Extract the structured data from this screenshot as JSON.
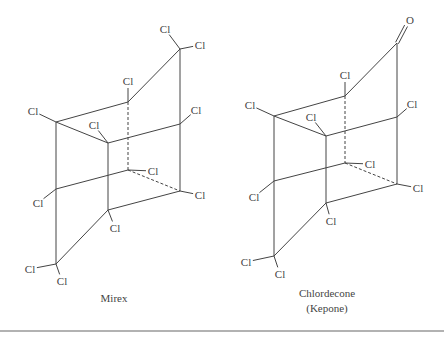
{
  "molecules": [
    {
      "name": "Mirex",
      "caption": [
        "Mirex"
      ],
      "caption_pos": [
        114,
        291
      ],
      "vertices": {
        "top": [
          180,
          49
        ],
        "tm": [
          128,
          102
        ],
        "tl": [
          56,
          122
        ],
        "ft": [
          108,
          143
        ],
        "rt": [
          180,
          124
        ],
        "bb": [
          128,
          170
        ],
        "lb": [
          56,
          189
        ],
        "fb": [
          108,
          210
        ],
        "rb": [
          180,
          191
        ],
        "bot": [
          56,
          264
        ]
      },
      "bonds": [
        [
          "top",
          "tm"
        ],
        [
          "top",
          "rt"
        ],
        [
          "tm",
          "tl"
        ],
        [
          "tl",
          "ft"
        ],
        [
          "ft",
          "rt"
        ],
        [
          "tl",
          "lb"
        ],
        [
          "ft",
          "fb"
        ],
        [
          "rt",
          "rb"
        ],
        [
          "lb",
          "bb"
        ],
        [
          "fb",
          "rb"
        ],
        [
          "fb",
          "bot"
        ],
        [
          "lb",
          "bot"
        ]
      ],
      "dashed_bonds": [
        [
          "tm",
          "bb"
        ],
        [
          "bb",
          "rb"
        ]
      ],
      "substituents": [
        {
          "from": "top",
          "label": "Cl",
          "pos": [
            165,
            29
          ]
        },
        {
          "from": "top",
          "label": "Cl",
          "pos": [
            200,
            45
          ]
        },
        {
          "from": "tm",
          "label": "Cl",
          "pos": [
            128,
            81
          ]
        },
        {
          "from": "tl",
          "label": "Cl",
          "pos": [
            33,
            111
          ]
        },
        {
          "from": "ft",
          "label": "Cl",
          "pos": [
            94,
            125
          ]
        },
        {
          "from": "rt",
          "label": "Cl",
          "pos": [
            196,
            110
          ]
        },
        {
          "from": "bb",
          "label": "Cl",
          "pos": [
            153,
            171
          ]
        },
        {
          "from": "lb",
          "label": "Cl",
          "pos": [
            38,
            203
          ]
        },
        {
          "from": "rb",
          "label": "Cl",
          "pos": [
            200,
            195
          ]
        },
        {
          "from": "fb",
          "label": "Cl",
          "pos": [
            115,
            228
          ]
        },
        {
          "from": "bot",
          "label": "Cl",
          "pos": [
            30,
            269
          ]
        },
        {
          "from": "bot",
          "label": "Cl",
          "pos": [
            62,
            281
          ]
        }
      ]
    },
    {
      "name": "Chlordecone",
      "caption": [
        "Chlordecone",
        "(Kepone)"
      ],
      "caption_pos": [
        327,
        286
      ],
      "vertices": {
        "top": [
          397,
          43
        ],
        "tm": [
          345,
          96
        ],
        "tl": [
          274,
          116
        ],
        "ft": [
          326,
          136
        ],
        "rt": [
          397,
          117
        ],
        "bb": [
          345,
          163
        ],
        "lb": [
          274,
          181
        ],
        "fb": [
          326,
          203
        ],
        "rb": [
          397,
          184
        ],
        "bot": [
          274,
          256
        ]
      },
      "bonds": [
        [
          "top",
          "tm"
        ],
        [
          "top",
          "rt"
        ],
        [
          "tm",
          "tl"
        ],
        [
          "tl",
          "ft"
        ],
        [
          "ft",
          "rt"
        ],
        [
          "tl",
          "lb"
        ],
        [
          "ft",
          "fb"
        ],
        [
          "rt",
          "rb"
        ],
        [
          "lb",
          "bb"
        ],
        [
          "fb",
          "rb"
        ],
        [
          "fb",
          "bot"
        ],
        [
          "lb",
          "bot"
        ]
      ],
      "dashed_bonds": [
        [
          "tm",
          "bb"
        ],
        [
          "bb",
          "rb"
        ]
      ],
      "double_bond": {
        "from": "top",
        "to_label": "O",
        "to": [
          407,
          24
        ],
        "label_pos": [
          410,
          20
        ]
      },
      "substituents": [
        {
          "from": "tm",
          "label": "Cl",
          "pos": [
            345,
            75
          ]
        },
        {
          "from": "tl",
          "label": "Cl",
          "pos": [
            250,
            105
          ]
        },
        {
          "from": "ft",
          "label": "Cl",
          "pos": [
            311,
            117
          ]
        },
        {
          "from": "rt",
          "label": "Cl",
          "pos": [
            412,
            104
          ]
        },
        {
          "from": "bb",
          "label": "Cl",
          "pos": [
            370,
            164
          ]
        },
        {
          "from": "lb",
          "label": "Cl",
          "pos": [
            254,
            197
          ]
        },
        {
          "from": "rb",
          "label": "Cl",
          "pos": [
            418,
            188
          ]
        },
        {
          "from": "fb",
          "label": "Cl",
          "pos": [
            331,
            221
          ]
        },
        {
          "from": "bot",
          "label": "Cl",
          "pos": [
            246,
            262
          ]
        },
        {
          "from": "bot",
          "label": "Cl",
          "pos": [
            280,
            274
          ]
        }
      ]
    }
  ],
  "divider_y": 331
}
